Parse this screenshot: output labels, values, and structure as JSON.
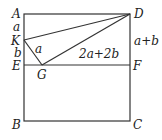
{
  "diagram": {
    "type": "geometry",
    "points": {
      "A": {
        "label": "A",
        "x": 24,
        "y": 14
      },
      "D": {
        "label": "D",
        "x": 130,
        "y": 14
      },
      "K": {
        "label": "K",
        "x": 24,
        "y": 40
      },
      "E": {
        "label": "E",
        "x": 24,
        "y": 65
      },
      "G": {
        "label": "G",
        "x": 42,
        "y": 65
      },
      "F": {
        "label": "F",
        "x": 130,
        "y": 65
      },
      "B": {
        "label": "B",
        "x": 24,
        "y": 121
      },
      "C": {
        "label": "C",
        "x": 130,
        "y": 121
      }
    },
    "segment_labels": {
      "AK": "a",
      "KE": "b",
      "KG": "a",
      "GD": "2a+2b",
      "DF": "a+b"
    }
  }
}
